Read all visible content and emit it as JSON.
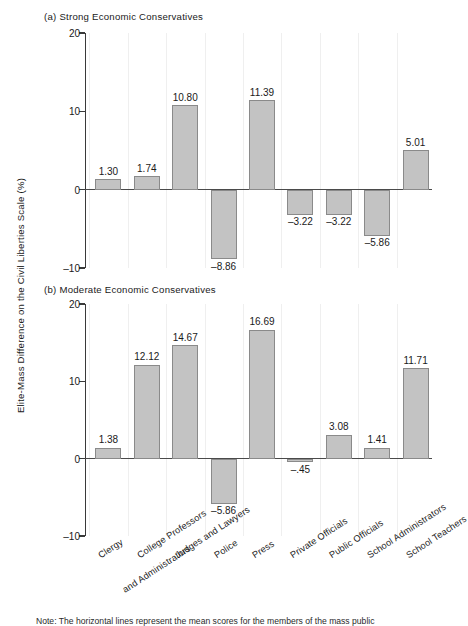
{
  "figure": {
    "ylabel": "Elite-Mass Difference on the Civil Liberties Scale (%)",
    "note": "Note: The horizontal lines represent the mean scores for the members of the mass public"
  },
  "axis": {
    "tick_labels": [
      "20",
      "10",
      "0",
      "–10"
    ],
    "tick_values": [
      20,
      10,
      0,
      -10
    ]
  },
  "panels": [
    {
      "title": "(a) Strong Economic Conservatives"
    },
    {
      "title": "(b) Moderate Economic Conservatives"
    }
  ],
  "categories": [
    "Clergy",
    "College Professors and Administrators",
    "Judges and Lawyers",
    "Police",
    "Press",
    "Private Officials",
    "Public Officials",
    "School Administrators",
    "School Teachers"
  ],
  "category_lines": [
    [
      "Clergy"
    ],
    [
      "College Professors",
      "and Administrators"
    ],
    [
      "Judges and Lawyers"
    ],
    [
      "Police"
    ],
    [
      "Press"
    ],
    [
      "Private Officials"
    ],
    [
      "Public Officials"
    ],
    [
      "School Administrators"
    ],
    [
      "School Teachers"
    ]
  ],
  "value_labels": {
    "a": [
      "1.30",
      "1.74",
      "10.80",
      "–8.86",
      "11.39",
      "–3.22",
      "–3.22",
      "–5.86",
      "5.01"
    ],
    "b": [
      "1.38",
      "12.12",
      "14.67",
      "–5.86",
      "16.69",
      "–.45",
      "3.08",
      "1.41",
      "11.71"
    ]
  },
  "colors": {
    "bar_fill": "#c3c3c3",
    "bar_stroke": "#8a8a8a",
    "axis": "#3a3a3a",
    "grid": "#efefef",
    "text": "#1a1a1a"
  },
  "chart_data": [
    {
      "type": "bar",
      "title": "(a) Strong Economic Conservatives",
      "xlabel": "",
      "ylabel": "Elite-Mass Difference on the Civil Liberties Scale (%)",
      "ylim": [
        -10,
        20
      ],
      "yticks": [
        -10,
        0,
        10,
        20
      ],
      "grid": true,
      "legend": "none",
      "categories": [
        "Clergy",
        "College Professors and Administrators",
        "Judges and Lawyers",
        "Police",
        "Press",
        "Private Officials",
        "Public Officials",
        "School Administrators",
        "School Teachers"
      ],
      "values": [
        1.3,
        1.74,
        10.8,
        -8.86,
        11.39,
        -3.22,
        -3.22,
        -5.86,
        5.01
      ]
    },
    {
      "type": "bar",
      "title": "(b) Moderate Economic Conservatives",
      "xlabel": "",
      "ylabel": "Elite-Mass Difference on the Civil Liberties Scale (%)",
      "ylim": [
        -10,
        20
      ],
      "yticks": [
        -10,
        0,
        10,
        20
      ],
      "grid": true,
      "legend": "none",
      "categories": [
        "Clergy",
        "College Professors and Administrators",
        "Judges and Lawyers",
        "Police",
        "Press",
        "Private Officials",
        "Public Officials",
        "School Administrators",
        "School Teachers"
      ],
      "values": [
        1.38,
        12.12,
        14.67,
        -5.86,
        16.69,
        -0.45,
        3.08,
        1.41,
        11.71
      ]
    }
  ]
}
